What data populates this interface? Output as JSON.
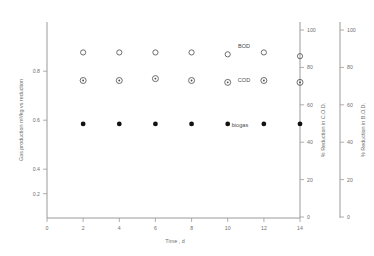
{
  "chart_data": {
    "type": "scatter",
    "title": "",
    "xlabel": "Time , d",
    "ylabel": "Gas production m³/kg vs reduction",
    "x": [
      2,
      4,
      6,
      8,
      10,
      12,
      14
    ],
    "xlim": [
      0,
      14
    ],
    "xticks": [
      0,
      2,
      4,
      6,
      8,
      10,
      12,
      14
    ],
    "xticklabels": [
      "0",
      "2",
      "4",
      "6",
      "8",
      "10",
      "12",
      "14"
    ],
    "ylim": [
      0,
      1.0
    ],
    "yticks": [
      0.2,
      0.4,
      0.6,
      0.8
    ],
    "yticklabels": [
      "0.2",
      "0.4",
      "0.6",
      "0.8"
    ],
    "grid": false,
    "legend": "inline-annotations",
    "secondary_axes": [
      {
        "name": "cod-axis",
        "label": "% Reduction in C.O.D.",
        "lim": [
          0,
          100
        ],
        "ticks": [
          0,
          20,
          40,
          60,
          80,
          100
        ],
        "ticklabels": [
          "0",
          "20",
          "40",
          "60",
          "80",
          "100"
        ]
      },
      {
        "name": "bod-axis",
        "label": "% Reduction in B.O.D.",
        "lim": [
          0,
          100
        ],
        "ticks": [
          0,
          20,
          40,
          60,
          80,
          100
        ],
        "ticklabels": [
          "0",
          "20",
          "40",
          "60",
          "80",
          "100"
        ]
      }
    ],
    "series": [
      {
        "name": "BOD",
        "label": "BOD",
        "marker": "open-circle",
        "axis": "bod-axis",
        "unit": "%",
        "values": [
          88,
          88,
          88,
          88,
          87,
          88,
          86
        ]
      },
      {
        "name": "COD",
        "label": "COD",
        "marker": "circle-with-dot",
        "axis": "cod-axis",
        "unit": "%",
        "values": [
          73,
          73,
          74,
          73,
          72,
          73,
          72
        ]
      },
      {
        "name": "biogas",
        "label": "biogas",
        "marker": "filled-circle",
        "axis": "left",
        "unit": "m³/kg",
        "values": [
          0.48,
          0.48,
          0.48,
          0.48,
          0.48,
          0.48,
          0.48
        ]
      }
    ]
  },
  "annotations": {
    "bod": "BOD",
    "cod": "COD",
    "biogas": "biogas"
  }
}
